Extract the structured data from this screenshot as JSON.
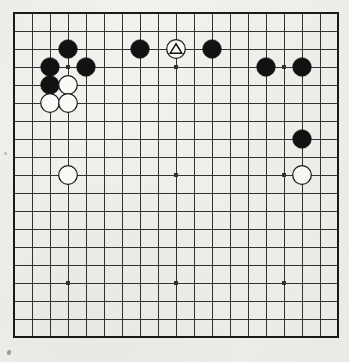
{
  "diagram": {
    "kind": "go-board-diagram",
    "board_size": 19,
    "background_color": "#f2f1ee",
    "line_color": "#35332f",
    "border_color": "#1a1a18",
    "black_stone_color": "#121212",
    "white_stone_color": "#fbfbf9",
    "white_stone_outline": "#1a1a18",
    "marker_color": "#121212",
    "geometry": {
      "origin_x": 14,
      "origin_y": 13,
      "spacing": 18,
      "stone_radius": 9.3,
      "line_width": 1.0,
      "border_width": 2.6,
      "hoshi_radius": 2.2
    },
    "star_points": [
      {
        "col": 3,
        "row": 3
      },
      {
        "col": 9,
        "row": 3
      },
      {
        "col": 15,
        "row": 3
      },
      {
        "col": 3,
        "row": 9
      },
      {
        "col": 9,
        "row": 9
      },
      {
        "col": 15,
        "row": 9
      },
      {
        "col": 3,
        "row": 15
      },
      {
        "col": 9,
        "row": 15
      },
      {
        "col": 15,
        "row": 15
      }
    ],
    "stones": [
      {
        "id": "b-c3-r2",
        "color": "black",
        "col": 3,
        "row": 2,
        "marker": "none"
      },
      {
        "id": "b-c2-r3",
        "color": "black",
        "col": 2,
        "row": 3,
        "marker": "none"
      },
      {
        "id": "b-c4-r3",
        "color": "black",
        "col": 4,
        "row": 3,
        "marker": "none"
      },
      {
        "id": "b-c2-r4",
        "color": "black",
        "col": 2,
        "row": 4,
        "marker": "none"
      },
      {
        "id": "w-c3-r4",
        "color": "white",
        "col": 3,
        "row": 4,
        "marker": "none"
      },
      {
        "id": "w-c2-r5",
        "color": "white",
        "col": 2,
        "row": 5,
        "marker": "none"
      },
      {
        "id": "w-c3-r5",
        "color": "white",
        "col": 3,
        "row": 5,
        "marker": "none"
      },
      {
        "id": "w-c3-r9",
        "color": "white",
        "col": 3,
        "row": 9,
        "marker": "none"
      },
      {
        "id": "b-c7-r2",
        "color": "black",
        "col": 7,
        "row": 2,
        "marker": "none"
      },
      {
        "id": "w-c9-r2",
        "color": "white",
        "col": 9,
        "row": 2,
        "marker": "triangle"
      },
      {
        "id": "b-c11-r2",
        "color": "black",
        "col": 11,
        "row": 2,
        "marker": "none"
      },
      {
        "id": "b-c14-r3",
        "color": "black",
        "col": 14,
        "row": 3,
        "marker": "none"
      },
      {
        "id": "b-c16-r3",
        "color": "black",
        "col": 16,
        "row": 3,
        "marker": "none"
      },
      {
        "id": "b-c16-r7",
        "color": "black",
        "col": 16,
        "row": 7,
        "marker": "none"
      },
      {
        "id": "w-c16-r9",
        "color": "white",
        "col": 16,
        "row": 9,
        "marker": "none"
      }
    ],
    "markers": {
      "triangle_label": "triangle-marker"
    },
    "stone_counts": {
      "black": 9,
      "white": 6
    }
  }
}
